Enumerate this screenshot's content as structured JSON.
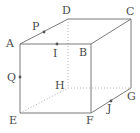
{
  "figure": {
    "name": "labelled-cube",
    "width": 140,
    "height": 133,
    "background": "#ffffff",
    "stroke_solid": "#7a7a7a",
    "stroke_hidden": "#b4b4b4",
    "label_color": "#4a4a4a",
    "point_color": "#555555"
  },
  "vertices": [
    {
      "id": "A",
      "label": "A",
      "x": 20,
      "y": 44,
      "label_x": 6,
      "label_y": 38,
      "hidden": false
    },
    {
      "id": "B",
      "label": "B",
      "x": 91,
      "y": 44,
      "label_x": 79,
      "label_y": 47,
      "hidden": false
    },
    {
      "id": "C",
      "label": "C",
      "x": 131,
      "y": 19,
      "label_x": 126,
      "label_y": 6,
      "hidden": false
    },
    {
      "id": "D",
      "label": "D",
      "x": 68,
      "y": 19,
      "label_x": 62,
      "label_y": 5,
      "hidden": false
    },
    {
      "id": "E",
      "label": "E",
      "x": 20,
      "y": 113,
      "label_x": 9,
      "label_y": 115,
      "hidden": false
    },
    {
      "id": "F",
      "label": "F",
      "x": 91,
      "y": 113,
      "label_x": 86,
      "label_y": 115,
      "hidden": false
    },
    {
      "id": "G",
      "label": "G",
      "x": 131,
      "y": 88,
      "label_x": 127,
      "label_y": 91,
      "hidden": false
    },
    {
      "id": "H",
      "label": "H",
      "x": 68,
      "y": 88,
      "label_x": 55,
      "label_y": 80,
      "hidden": true
    }
  ],
  "marked_points": [
    {
      "id": "P",
      "label": "P",
      "x": 44,
      "y": 32,
      "label_x": 32,
      "label_y": 21,
      "on_edge": "A-D"
    },
    {
      "id": "Q",
      "label": "Q",
      "x": 20,
      "y": 77,
      "label_x": 7,
      "label_y": 72,
      "on_edge": "A-E"
    },
    {
      "id": "I",
      "label": "I",
      "x": 57,
      "y": 44,
      "label_x": 53,
      "label_y": 48,
      "on_edge": "A-B"
    },
    {
      "id": "J",
      "label": "J",
      "x": 111,
      "y": 101,
      "label_x": 107,
      "label_y": 103,
      "on_edge": "F-G"
    }
  ],
  "edges_solid": [
    {
      "id": "A-B",
      "from": "A",
      "to": "B"
    },
    {
      "id": "B-F",
      "from": "B",
      "to": "F"
    },
    {
      "id": "F-E",
      "from": "F",
      "to": "E"
    },
    {
      "id": "E-A",
      "from": "E",
      "to": "A"
    },
    {
      "id": "D-C",
      "from": "D",
      "to": "C"
    },
    {
      "id": "C-G",
      "from": "C",
      "to": "G"
    },
    {
      "id": "A-D",
      "from": "A",
      "to": "D"
    },
    {
      "id": "B-C",
      "from": "B",
      "to": "C"
    },
    {
      "id": "F-G",
      "from": "F",
      "to": "G"
    }
  ],
  "edges_hidden": [
    {
      "id": "D-H",
      "from": "D",
      "to": "H"
    },
    {
      "id": "H-G",
      "from": "H",
      "to": "G"
    },
    {
      "id": "E-H",
      "from": "E",
      "to": "H"
    }
  ]
}
